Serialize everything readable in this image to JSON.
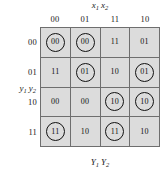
{
  "figure": {
    "type": "karnaugh-map",
    "top_label": {
      "var": "x",
      "sub1": "1",
      "sub2": "2",
      "full": "x1 x2"
    },
    "left_label": {
      "var": "y",
      "sub1": "1",
      "sub2": "2",
      "full": "y1 y2"
    },
    "bottom_label": {
      "var": "Y",
      "sub1": "1",
      "sub2": "2",
      "full": "Y1 Y2"
    },
    "column_headers": [
      "00",
      "01",
      "11",
      "10"
    ],
    "row_headers": [
      "00",
      "01",
      "10",
      "11"
    ],
    "rows": [
      {
        "header": "00",
        "cells": [
          {
            "value": "00",
            "circled": true
          },
          {
            "value": "00",
            "circled": true
          },
          {
            "value": "11",
            "circled": false
          },
          {
            "value": "01",
            "circled": false
          }
        ]
      },
      {
        "header": "01",
        "cells": [
          {
            "value": "11",
            "circled": false
          },
          {
            "value": "01",
            "circled": true
          },
          {
            "value": "10",
            "circled": false
          },
          {
            "value": "01",
            "circled": true
          }
        ]
      },
      {
        "header": "10",
        "cells": [
          {
            "value": "00",
            "circled": false
          },
          {
            "value": "00",
            "circled": false
          },
          {
            "value": "10",
            "circled": true
          },
          {
            "value": "10",
            "circled": true
          }
        ]
      },
      {
        "header": "11",
        "cells": [
          {
            "value": "11",
            "circled": true
          },
          {
            "value": "10",
            "circled": false
          },
          {
            "value": "11",
            "circled": true
          },
          {
            "value": "10",
            "circled": false
          }
        ]
      }
    ],
    "colors": {
      "cell_fill": "#dcdcdc",
      "grid_line": "#6e6e6e",
      "text": "#111111",
      "circle": "#111111",
      "background": "#ffffff"
    }
  }
}
